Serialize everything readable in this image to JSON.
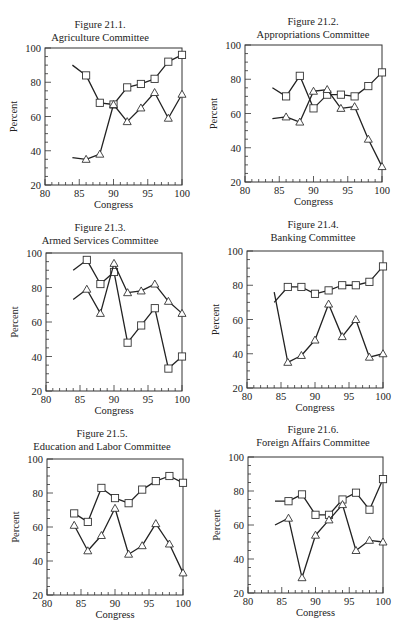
{
  "chart_data": [
    {
      "type": "line",
      "title": "Figure 21.1.",
      "subtitle": "Agriculture Committee",
      "xlabel": "Congress",
      "ylabel": "Percent",
      "xlim": [
        80,
        100
      ],
      "ylim": [
        20,
        100
      ],
      "xticks": [
        80,
        85,
        90,
        95,
        100
      ],
      "yticks": [
        20,
        40,
        60,
        80,
        100
      ],
      "grid": false,
      "x": [
        84,
        86,
        88,
        90,
        92,
        94,
        96,
        98,
        100
      ],
      "series": [
        {
          "name": "squares",
          "marker": "square",
          "marker_start": false,
          "values": [
            90,
            84,
            68,
            67,
            77,
            79,
            82,
            92,
            96
          ]
        },
        {
          "name": "triangles",
          "marker": "triangle",
          "marker_start": false,
          "values": [
            36,
            35,
            38,
            67,
            57,
            65,
            74,
            59,
            73
          ]
        }
      ]
    },
    {
      "type": "line",
      "title": "Figure 21.2.",
      "subtitle": "Appropriations Committee",
      "xlabel": "Congress",
      "ylabel": "Percent",
      "xlim": [
        80,
        100
      ],
      "ylim": [
        20,
        100
      ],
      "xticks": [
        80,
        85,
        90,
        95,
        100
      ],
      "yticks": [
        20,
        40,
        60,
        80,
        100
      ],
      "grid": false,
      "x": [
        84,
        86,
        88,
        90,
        92,
        94,
        96,
        98,
        100
      ],
      "series": [
        {
          "name": "squares",
          "marker": "square",
          "marker_start": false,
          "values": [
            75,
            70,
            82,
            63,
            71,
            71,
            70,
            76,
            84
          ]
        },
        {
          "name": "triangles",
          "marker": "triangle",
          "marker_start": false,
          "values": [
            57,
            58,
            55,
            73,
            74,
            63,
            64,
            45,
            29
          ]
        }
      ]
    },
    {
      "type": "line",
      "title": "Figure 21.3.",
      "subtitle": "Armed Services Committee",
      "xlabel": "Congress",
      "ylabel": "Percent",
      "xlim": [
        80,
        100
      ],
      "ylim": [
        20,
        100
      ],
      "xticks": [
        80,
        85,
        90,
        95,
        100
      ],
      "yticks": [
        20,
        40,
        60,
        80,
        100
      ],
      "grid": false,
      "x": [
        84,
        86,
        88,
        90,
        92,
        94,
        96,
        98,
        100
      ],
      "series": [
        {
          "name": "squares",
          "marker": "square",
          "marker_start": false,
          "values": [
            90,
            96,
            82,
            89,
            48,
            58,
            68,
            33,
            40
          ]
        },
        {
          "name": "triangles",
          "marker": "triangle",
          "marker_start": false,
          "values": [
            73,
            79,
            65,
            94,
            77,
            78,
            82,
            72,
            65
          ]
        }
      ]
    },
    {
      "type": "line",
      "title": "Figure 21.4.",
      "subtitle": "Banking Committee",
      "xlabel": "Congress",
      "ylabel": "Percent",
      "xlim": [
        80,
        100
      ],
      "ylim": [
        20,
        100
      ],
      "xticks": [
        80,
        85,
        90,
        95,
        100
      ],
      "yticks": [
        20,
        40,
        60,
        80,
        100
      ],
      "grid": false,
      "x": [
        84,
        86,
        88,
        90,
        92,
        94,
        96,
        98,
        100
      ],
      "series": [
        {
          "name": "squares",
          "marker": "square",
          "marker_start": false,
          "values": [
            70,
            79,
            79,
            75,
            77,
            80,
            80,
            82,
            91
          ]
        },
        {
          "name": "triangles",
          "marker": "triangle",
          "marker_start": false,
          "values": [
            76,
            35,
            39,
            48,
            69,
            50,
            60,
            38,
            40
          ]
        }
      ]
    },
    {
      "type": "line",
      "title": "Figure 21.5.",
      "subtitle": "Education and Labor Committee",
      "xlabel": "Congress",
      "ylabel": "Percent",
      "xlim": [
        80,
        100
      ],
      "ylim": [
        20,
        100
      ],
      "xticks": [
        80,
        85,
        90,
        95,
        100
      ],
      "yticks": [
        20,
        40,
        60,
        80,
        100
      ],
      "grid": false,
      "x": [
        84,
        86,
        88,
        90,
        92,
        94,
        96,
        98,
        100
      ],
      "series": [
        {
          "name": "squares",
          "marker": "square",
          "marker_start": true,
          "values": [
            68,
            63,
            83,
            77,
            74,
            82,
            87,
            90,
            86
          ]
        },
        {
          "name": "triangles",
          "marker": "triangle",
          "marker_start": true,
          "values": [
            61,
            46,
            55,
            71,
            44,
            49,
            62,
            50,
            33
          ]
        }
      ]
    },
    {
      "type": "line",
      "title": "Figure 21.6.",
      "subtitle": "Foreign Affairs Committee",
      "xlabel": "Congress",
      "ylabel": "Percent",
      "xlim": [
        80,
        100
      ],
      "ylim": [
        20,
        100
      ],
      "xticks": [
        80,
        85,
        90,
        95,
        100
      ],
      "yticks": [
        20,
        40,
        60,
        80,
        100
      ],
      "grid": false,
      "x": [
        84,
        86,
        88,
        90,
        92,
        94,
        96,
        98,
        100
      ],
      "series": [
        {
          "name": "squares",
          "marker": "square",
          "marker_start": false,
          "values": [
            74,
            74,
            78,
            66,
            66,
            75,
            79,
            69,
            87
          ]
        },
        {
          "name": "triangles",
          "marker": "triangle",
          "marker_start": false,
          "values": [
            60,
            64,
            29,
            54,
            63,
            72,
            45,
            51,
            50
          ]
        }
      ]
    }
  ],
  "layout": {
    "panels": [
      {
        "title_cx": 100,
        "title_y": 18,
        "left": 45,
        "right": 182,
        "top": 48,
        "bottom": 185
      },
      {
        "title_cx": 313,
        "title_y": 15,
        "left": 245,
        "right": 382,
        "top": 45,
        "bottom": 182
      },
      {
        "title_cx": 100,
        "title_y": 221,
        "left": 46,
        "right": 182,
        "top": 253,
        "bottom": 391
      },
      {
        "title_cx": 313,
        "title_y": 218,
        "left": 247,
        "right": 383,
        "top": 251,
        "bottom": 388
      },
      {
        "title_cx": 102,
        "title_y": 427,
        "left": 47,
        "right": 183,
        "top": 459,
        "bottom": 595
      },
      {
        "title_cx": 313,
        "title_y": 423,
        "left": 248,
        "right": 383,
        "top": 457,
        "bottom": 593
      }
    ]
  }
}
